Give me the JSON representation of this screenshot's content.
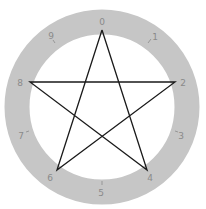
{
  "diagram": {
    "ring_color": "#c4c4c4",
    "line_color": "#1a1a1a",
    "labels": [
      "0",
      "1",
      "2",
      "3",
      "4",
      "5",
      "6",
      "7",
      "8",
      "9"
    ],
    "star_connects": [
      "0",
      "4",
      "8",
      "2",
      "6",
      "0"
    ]
  }
}
